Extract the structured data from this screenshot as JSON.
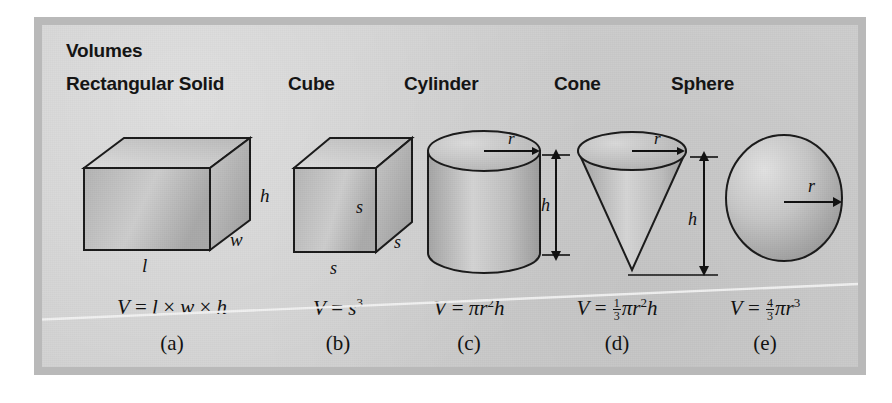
{
  "figure": {
    "title": "Volumes",
    "background_color": "#cfcfcf",
    "border_color": "#b9b9b9",
    "ink_color": "#101010"
  },
  "columns": [
    {
      "id": "rectangular-solid",
      "header": "Rectangular Solid",
      "shape": "rectangular-solid",
      "dimension_labels": [
        "h",
        "w",
        "l"
      ],
      "formula_plain": "V = l × w × h",
      "caption": "(a)"
    },
    {
      "id": "cube",
      "header": "Cube",
      "shape": "cube",
      "dimension_labels": [
        "s",
        "s",
        "s"
      ],
      "formula_plain": "V = s³",
      "caption": "(b)"
    },
    {
      "id": "cylinder",
      "header": "Cylinder",
      "shape": "cylinder",
      "dimension_labels": [
        "r",
        "h"
      ],
      "formula_plain": "V = πr²h",
      "caption": "(c)"
    },
    {
      "id": "cone",
      "header": "Cone",
      "shape": "cone",
      "dimension_labels": [
        "r",
        "h"
      ],
      "formula_plain": "V = 1/3 πr²h",
      "caption": "(d)"
    },
    {
      "id": "sphere",
      "header": "Sphere",
      "shape": "sphere",
      "dimension_labels": [
        "r"
      ],
      "formula_plain": "V = 4/3 πr³",
      "caption": "(e)"
    }
  ],
  "labels": {
    "V": "V",
    "equals": "=",
    "times": "×",
    "l": "l",
    "w": "w",
    "h": "h",
    "s": "s",
    "r": "r",
    "pi": "π",
    "exp2": "2",
    "exp3": "3",
    "one": "1",
    "three": "3",
    "four": "4"
  }
}
